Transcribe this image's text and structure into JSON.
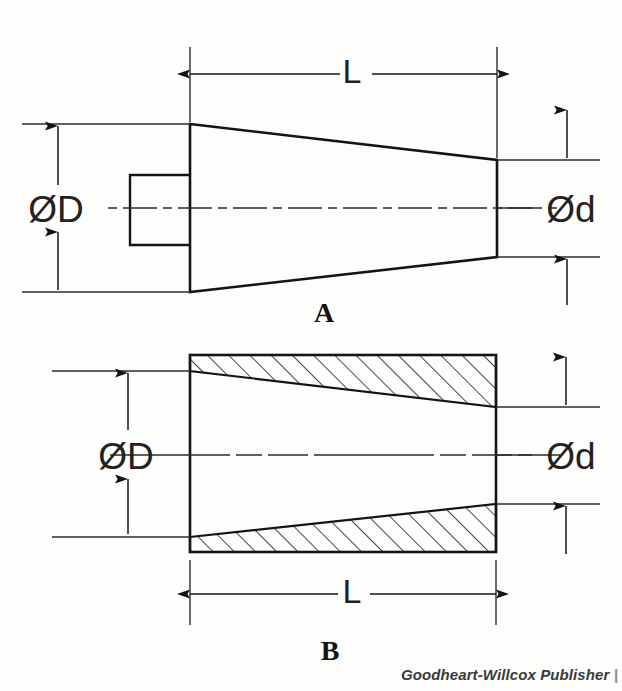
{
  "figure": {
    "title_hidden": "",
    "caption_credit": "Goodheart-Willcox Publisher",
    "caption_credit_tail": "|"
  },
  "views": [
    {
      "id": "A",
      "label": "A",
      "description": "external view of tapered plug with rectangular tang",
      "dimensions": {
        "length_label": "L",
        "large_diameter_label": "ØD",
        "small_diameter_label": "Ød"
      }
    },
    {
      "id": "B",
      "label": "B",
      "description": "sectioned view of tapered socket with hatching",
      "dimensions": {
        "length_label": "L",
        "large_diameter_label": "ØD",
        "small_diameter_label": "Ød"
      }
    }
  ],
  "colors": {
    "line": "#141414",
    "thin_line": "#2b2b2b",
    "background": "#fdfdfc",
    "hatch": "#1a1a1a",
    "credit": "#3a3a3a"
  },
  "geometry": {
    "view_a": {
      "taper_top_left_y": 124,
      "taper_bottom_left_y": 292,
      "taper_top_right_y": 160,
      "taper_bottom_right_y": 257,
      "left_x": 190,
      "right_x": 497,
      "tang_x": 130,
      "tang_top_y": 175,
      "tang_bottom_y": 245,
      "centerline_y": 208,
      "dim_l_y": 65
    },
    "view_b": {
      "rect_left_x": 190,
      "rect_right_x": 496,
      "rect_top_y": 355,
      "rect_bottom_y": 552,
      "hole_top_left_y": 371,
      "hole_top_right_y": 407,
      "hole_bottom_left_y": 537,
      "hole_bottom_right_y": 504,
      "centerline_y": 455,
      "dim_l_y": 594
    }
  }
}
